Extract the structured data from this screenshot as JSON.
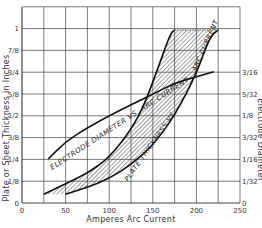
{
  "chart_data": {
    "type": "line",
    "title": "",
    "xlabel": "Amperes Arc Current",
    "ylabel_left": "Plate or Sheet Thickness in Inches",
    "ylabel_right": "Electrode Diameter",
    "xlim": [
      0,
      250
    ],
    "x_ticks": [
      "0",
      "50",
      "100",
      "150",
      "200",
      "250"
    ],
    "y_left_ticks": [
      "0",
      "1/8",
      "1/4",
      "3/8",
      "1/2",
      "5/8",
      "3/4",
      "7/8",
      "1"
    ],
    "y_left_values": [
      0,
      0.125,
      0.25,
      0.375,
      0.5,
      0.625,
      0.75,
      0.875,
      1.0
    ],
    "y_right_ticks": [
      "0",
      "1/32",
      "1/16",
      "3/32",
      "1/8",
      "5/32",
      "3/16"
    ],
    "y_right_values": [
      0,
      0.03125,
      0.0625,
      0.09375,
      0.125,
      0.15625,
      0.1875
    ],
    "grid": true,
    "series": [
      {
        "name": "Electrode Diameter vs. Arc Current",
        "axis": "right",
        "x": [
          30,
          50,
          75,
          100,
          125,
          150,
          175,
          200,
          220
        ],
        "y": [
          0.063,
          0.088,
          0.108,
          0.125,
          0.141,
          0.156,
          0.172,
          0.181,
          0.188
        ]
      },
      {
        "name": "Plate Thickness vs. Arc Current (upper bound)",
        "axis": "left",
        "x": [
          25,
          50,
          75,
          100,
          125,
          140,
          155,
          170,
          175
        ],
        "y": [
          0.05,
          0.11,
          0.17,
          0.26,
          0.42,
          0.56,
          0.76,
          0.97,
          1.1
        ]
      },
      {
        "name": "Plate Thickness vs. Arc Current (lower bound)",
        "axis": "left",
        "x": [
          50,
          75,
          100,
          125,
          150,
          175,
          200,
          215,
          225
        ],
        "y": [
          0.05,
          0.09,
          0.14,
          0.22,
          0.33,
          0.5,
          0.74,
          0.95,
          1.1
        ]
      }
    ],
    "annotations": [
      "ELECTRODE DIAMETER VS. ARC CURRENT",
      "PLATE THICKNESS VS. ARC CURRENT"
    ]
  },
  "labels": {
    "electrode_curve": "ELECTRODE DIAMETER VS. ARC CURRENT",
    "plate_curve_a": "PLATE THICKNESS VS.",
    "plate_curve_b": "ARC CURRENT"
  }
}
